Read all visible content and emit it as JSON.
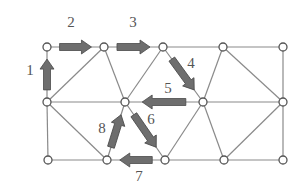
{
  "diagram": {
    "type": "triangular mesh with numbered traversal arrows",
    "colors": {
      "edge": "#8a8a8a",
      "node_fill": "#ffffff",
      "node_stroke": "#555555",
      "arrow": "#6e6e6e",
      "label": "#555555"
    },
    "nodes": [
      {
        "id": "t0",
        "x": 47,
        "y": 47
      },
      {
        "id": "t1",
        "x": 104,
        "y": 47
      },
      {
        "id": "t2",
        "x": 163,
        "y": 47
      },
      {
        "id": "t3",
        "x": 223,
        "y": 47
      },
      {
        "id": "t4",
        "x": 283,
        "y": 47
      },
      {
        "id": "m0",
        "x": 47,
        "y": 102
      },
      {
        "id": "m1",
        "x": 125,
        "y": 102
      },
      {
        "id": "m2",
        "x": 203,
        "y": 102
      },
      {
        "id": "m3",
        "x": 283,
        "y": 102
      },
      {
        "id": "b0",
        "x": 48,
        "y": 160
      },
      {
        "id": "b1",
        "x": 107,
        "y": 160
      },
      {
        "id": "b2",
        "x": 165,
        "y": 160
      },
      {
        "id": "b3",
        "x": 224,
        "y": 160
      },
      {
        "id": "b4",
        "x": 283,
        "y": 160
      }
    ],
    "arrows": [
      {
        "label": "1",
        "from": "m0",
        "to": "t0",
        "label_pos": [
          30,
          75
        ]
      },
      {
        "label": "2",
        "from": "t0",
        "to": "t1",
        "label_pos": [
          71,
          27
        ]
      },
      {
        "label": "3",
        "from": "t1",
        "to": "t2",
        "label_pos": [
          133,
          27
        ]
      },
      {
        "label": "4",
        "from": "t2",
        "to": "m2",
        "label_pos": [
          191,
          68
        ]
      },
      {
        "label": "5",
        "from": "m2",
        "to": "m1",
        "label_pos": [
          168,
          93
        ]
      },
      {
        "label": "6",
        "from": "m1",
        "to": "b2",
        "label_pos": [
          151,
          124
        ]
      },
      {
        "label": "7",
        "from": "b2",
        "to": "b1",
        "label_pos": [
          139,
          181
        ]
      },
      {
        "label": "8",
        "from": "b1",
        "to": "m1",
        "label_pos": [
          102,
          133
        ]
      }
    ]
  }
}
